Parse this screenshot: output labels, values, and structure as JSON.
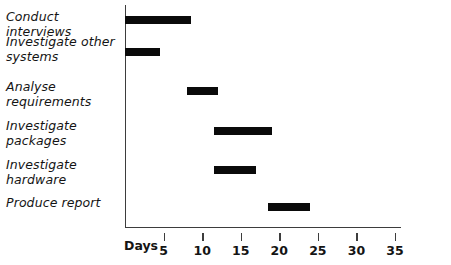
{
  "chart_data": {
    "type": "bar",
    "chart_variant": "gantt",
    "title": "",
    "xlabel": "Days",
    "ylabel": "",
    "xlim": [
      0,
      35
    ],
    "xticks": [
      5,
      10,
      15,
      20,
      25,
      30,
      35
    ],
    "xtick_labels": [
      "5",
      "10",
      "15",
      "20",
      "25",
      "30",
      "35"
    ],
    "grid": false,
    "legend": false,
    "bar_color": "#0a0a0a",
    "axis_color": "#3d3d3d",
    "categories": [
      "Conduct interviews",
      "Investigate other systems",
      "Analyse requirements",
      "Investigate packages",
      "Investigate hardware",
      "Produce report"
    ],
    "tasks": [
      {
        "name": "Conduct interviews",
        "start": 0,
        "end": 8.5,
        "duration": 8.5
      },
      {
        "name": "Investigate other systems",
        "start": 0,
        "end": 4.5,
        "duration": 4.5
      },
      {
        "name": "Analyse requirements",
        "start": 8.0,
        "end": 12.0,
        "duration": 4.0
      },
      {
        "name": "Investigate packages",
        "start": 11.5,
        "end": 19.0,
        "duration": 7.5
      },
      {
        "name": "Investigate hardware",
        "start": 11.5,
        "end": 17.0,
        "duration": 5.5
      },
      {
        "name": "Produce report",
        "start": 18.5,
        "end": 24.0,
        "duration": 5.5
      }
    ]
  },
  "axis": {
    "days_label": "Days"
  }
}
